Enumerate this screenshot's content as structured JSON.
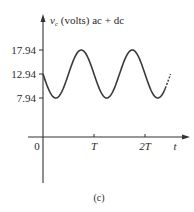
{
  "chart_data": {
    "type": "line",
    "title": "",
    "ylabel_var": "v",
    "ylabel_sub": "c",
    "ylabel_rest": " (volts) ac + dc",
    "xlabel": "t",
    "origin_label": "0",
    "x_ticks": [
      {
        "value": 1,
        "label": "T"
      },
      {
        "value": 2,
        "label": "2T"
      }
    ],
    "y_ticks": [
      {
        "value": 17.94,
        "label": "17.94"
      },
      {
        "value": 12.94,
        "label": "12.94"
      },
      {
        "value": 7.94,
        "label": "7.94"
      }
    ],
    "series": [
      {
        "name": "v_c",
        "formula": "12.94 - 5*sin(2*pi*t/T)",
        "dc_offset": 12.94,
        "amplitude": 5,
        "t_start": 0,
        "t_end": 2.5,
        "dashed_tail_from": 2.4,
        "x": [
          0,
          0.25,
          0.5,
          0.75,
          1.0,
          1.25,
          1.5,
          1.75,
          2.0,
          2.25,
          2.5
        ],
        "values": [
          12.94,
          7.94,
          12.94,
          17.94,
          12.94,
          7.94,
          12.94,
          17.94,
          12.94,
          7.94,
          12.94
        ]
      }
    ],
    "caption": "(c)",
    "grid": false,
    "legend": "none"
  }
}
